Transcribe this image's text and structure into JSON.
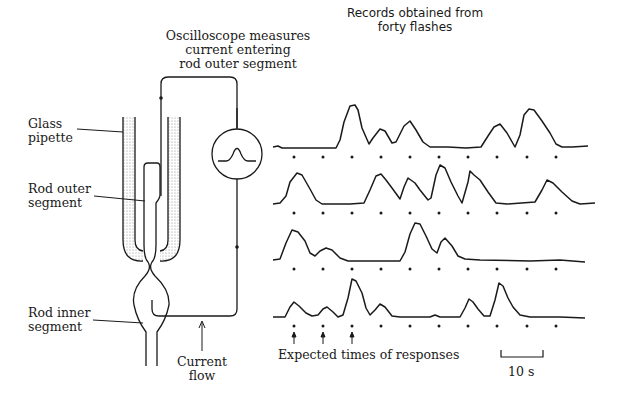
{
  "figure": {
    "apparatus_labels": {
      "oscilloscope": [
        "Oscilloscope measures",
        "current entering",
        "rod outer segment"
      ],
      "glass_pipette": [
        "Glass",
        "pipette"
      ],
      "rod_outer_segment": [
        "Rod outer",
        "segment"
      ],
      "rod_inner_segment": [
        "Rod inner",
        "segment"
      ],
      "current_flow": [
        "Current",
        "flow"
      ]
    },
    "records_title": [
      "Records obtained from",
      "forty flashes"
    ],
    "expected_times_label": "Expected times of responses",
    "scale_bar_label": "10 s",
    "colors": {
      "ink": "#1a1a1a",
      "stipple": "#8a8a8a",
      "background": "#ffffff"
    }
  },
  "traces": {
    "flashes_per_row": 10,
    "rows": 4,
    "dot_x": [
      294,
      323,
      352,
      381,
      410,
      439,
      468,
      497,
      527,
      556
    ],
    "row_responses": [
      [
        0,
        0,
        1,
        1,
        1,
        0,
        0,
        1,
        1,
        0
      ],
      [
        1,
        0,
        0,
        1,
        1,
        1,
        1,
        0,
        1,
        0
      ],
      [
        1,
        1,
        0,
        0,
        1,
        1,
        0,
        0,
        0,
        0
      ],
      [
        1,
        1,
        1,
        1,
        0,
        0,
        1,
        1,
        0,
        0
      ]
    ]
  }
}
